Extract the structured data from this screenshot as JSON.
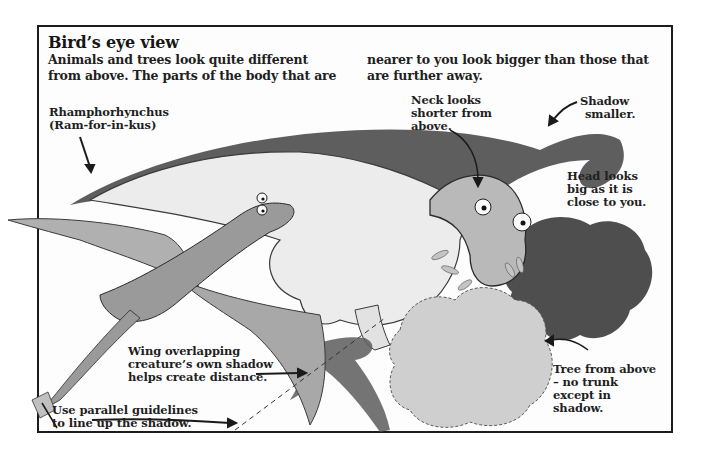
{
  "title": "Bird’s eye view",
  "intro": {
    "col1": [
      "Animals and trees look quite different",
      "from above. The parts of the body that are"
    ],
    "col2": [
      "nearer to you look bigger than those that",
      "are further away."
    ]
  },
  "labels": {
    "rhamphorhynchus": [
      "Rhamphorhynchus",
      "(Ram-for-in-kus)"
    ],
    "neck": [
      "Neck looks",
      "shorter from",
      "above."
    ],
    "shadow": [
      "Shadow",
      "smaller."
    ],
    "head": [
      "Head looks",
      "big as it is",
      "close to you."
    ],
    "wing": [
      "Wing overlapping",
      "creature’s own shadow",
      "helps create distance."
    ],
    "guidelines": [
      "Use parallel guidelines",
      "to line up the shadow."
    ],
    "tree": [
      "Tree from above",
      "– no trunk",
      "except in",
      "shadow."
    ]
  },
  "colors": {
    "frame": "#1c1c1c",
    "text": "#1f1f1f",
    "shadow_dark": "#4a4a4a",
    "dino_body": "#e6e6e6",
    "wing": "#a8a8a8",
    "tree": "#c8c8c8",
    "tree_shadow": "#555555"
  }
}
